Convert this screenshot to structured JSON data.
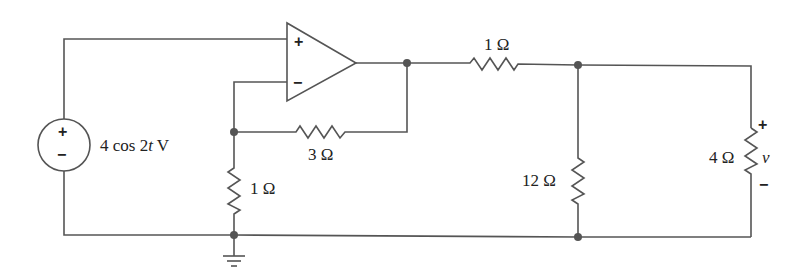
{
  "diagram": {
    "type": "circuit-schematic",
    "source": {
      "label": "4 cos 2t V",
      "label_parts": {
        "amp": "4 cos ",
        "coef": "2",
        "var": "t",
        "unit": " V"
      },
      "plus_sign": "+",
      "minus_sign": "−"
    },
    "opamp": {
      "plus_input": "+",
      "minus_input": "−"
    },
    "resistors": [
      {
        "id": "R_feedback",
        "label": "3 Ω"
      },
      {
        "id": "R_ground",
        "label": "1 Ω"
      },
      {
        "id": "R_series",
        "label": "1 Ω"
      },
      {
        "id": "R_shunt",
        "label": "12 Ω"
      },
      {
        "id": "R_load",
        "label": "4 Ω"
      }
    ],
    "output": {
      "var": "v",
      "plus_sign": "+",
      "minus_sign": "−"
    },
    "colors": {
      "wire": "#555555",
      "text": "#222222",
      "background": "#ffffff"
    }
  }
}
